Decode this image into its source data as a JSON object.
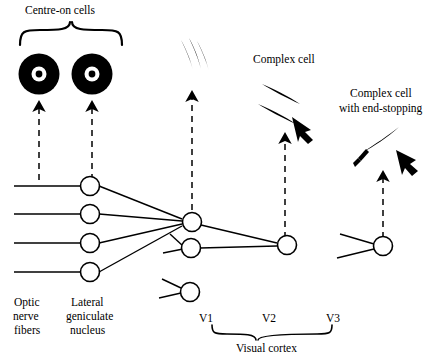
{
  "diagram": {
    "title_labels": {
      "centre_on_cells": "Centre-on cells",
      "complex_cell": "Complex cell",
      "complex_cell_end_stopping_line1": "Complex cell",
      "complex_cell_end_stopping_line2": "with end-stopping"
    },
    "left_labels": {
      "optic_line1": "Optic",
      "optic_line2": "nerve",
      "optic_line3": "fibers",
      "lgn_line1": "Lateral",
      "lgn_line2": "geniculate",
      "lgn_line3": "nucleus"
    },
    "cortex_labels": {
      "v1": "V1",
      "v2": "V2",
      "v3": "V3",
      "visual_cortex": "Visual cortex"
    },
    "icons": {
      "centre_on_receptive_field": "centre-on-receptive-field-icon",
      "oriented_bars_v1": "oriented-bars-icon",
      "oriented_bars_v2": "oriented-bars-complex-icon",
      "oriented_bar_end_stopped": "end-stopped-bar-icon",
      "arrow_motion": "motion-arrow-icon",
      "dashed_projection": "dashed-projection-arrow-icon",
      "neuron_soma": "neuron-soma-icon",
      "brace": "curly-brace-icon"
    },
    "colors": {
      "stroke": "#000000",
      "fill_dark": "#000000",
      "background": "#ffffff"
    }
  }
}
